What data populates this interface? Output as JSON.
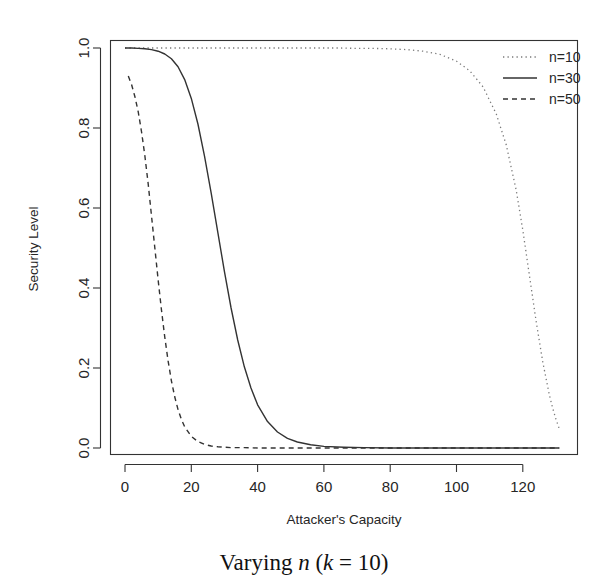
{
  "figure": {
    "caption_prefix": "Varying ",
    "caption_var_n": "n",
    "caption_mid": " (",
    "caption_var_k": "k",
    "caption_suffix": " = 10)"
  },
  "chart_data": {
    "type": "line",
    "title": "",
    "xlabel": "Attacker's Capacity",
    "ylabel": "Security Level",
    "xlim": [
      0,
      131
    ],
    "ylim": [
      0.0,
      1.0
    ],
    "xticks": [
      0,
      20,
      40,
      60,
      80,
      100,
      120
    ],
    "xtick_labels": [
      "0",
      "20",
      "40",
      "60",
      "80",
      "100",
      "120"
    ],
    "yticks": [
      0.0,
      0.2,
      0.4,
      0.6,
      0.8,
      1.0
    ],
    "ytick_labels": [
      "0.0",
      "0.2",
      "0.4",
      "0.6",
      "0.8",
      "1.0"
    ],
    "grid": false,
    "legend_position": "top-right",
    "box_style": "full-frame",
    "line_color": "#333333",
    "series": [
      {
        "name": "n=10",
        "style": "dotted",
        "dasharray": "1.3,3.2",
        "width": 1.3,
        "color": "#7a7a7a",
        "midpoint": 117.5,
        "steepness": 0.34,
        "ymax": 1.0,
        "x": [
          0,
          5,
          10,
          15,
          20,
          25,
          30,
          35,
          40,
          45,
          50,
          55,
          60,
          65,
          70,
          75,
          80,
          85,
          90,
          95,
          100,
          104,
          108,
          112,
          115,
          118,
          120,
          122,
          124,
          126,
          128,
          129,
          130,
          131
        ],
        "y": [
          1.0,
          1.0,
          1.0,
          1.0,
          1.0,
          1.0,
          1.0,
          1.0,
          1.0,
          1.0,
          1.0,
          1.0,
          1.0,
          1.0,
          0.999,
          0.999,
          0.998,
          0.996,
          0.992,
          0.984,
          0.967,
          0.943,
          0.903,
          0.835,
          0.758,
          0.645,
          0.545,
          0.431,
          0.318,
          0.216,
          0.133,
          0.1,
          0.072,
          0.048
        ]
      },
      {
        "name": "n=30",
        "style": "solid",
        "dasharray": "none",
        "width": 1.4,
        "color": "#333333",
        "midpoint": 29.5,
        "steepness": 0.115,
        "ymax": 1.0,
        "x": [
          0,
          2,
          4,
          6,
          8,
          10,
          12,
          14,
          16,
          18,
          20,
          22,
          24,
          26,
          28,
          30,
          32,
          34,
          36,
          38,
          40,
          43,
          46,
          49,
          52,
          56,
          60,
          66,
          72,
          80,
          90,
          100,
          110,
          120,
          131
        ],
        "y": [
          1.0,
          1.0,
          0.999,
          0.998,
          0.996,
          0.992,
          0.985,
          0.973,
          0.953,
          0.921,
          0.874,
          0.81,
          0.729,
          0.637,
          0.539,
          0.441,
          0.35,
          0.27,
          0.203,
          0.15,
          0.108,
          0.066,
          0.04,
          0.024,
          0.015,
          0.008,
          0.004,
          0.002,
          0.001,
          0.0,
          0.0,
          0.0,
          0.0,
          0.0,
          0.0
        ]
      },
      {
        "name": "n=50",
        "style": "dashed",
        "dasharray": "5,4",
        "width": 1.4,
        "color": "#333333",
        "midpoint": 9.0,
        "steepness": 0.33,
        "ymax": 0.93,
        "x": [
          1,
          2,
          3,
          4,
          5,
          6,
          7,
          8,
          9,
          10,
          11,
          12,
          13,
          14,
          15,
          16,
          17,
          18,
          20,
          22,
          24,
          26,
          28,
          32,
          36,
          40,
          50,
          60,
          70,
          85,
          100,
          115,
          131
        ],
        "y": [
          0.93,
          0.908,
          0.878,
          0.84,
          0.79,
          0.73,
          0.66,
          0.58,
          0.5,
          0.42,
          0.345,
          0.277,
          0.218,
          0.168,
          0.128,
          0.096,
          0.072,
          0.053,
          0.029,
          0.016,
          0.009,
          0.005,
          0.003,
          0.001,
          0.001,
          0.0,
          0.0,
          0.0,
          0.0,
          0.0,
          0.0,
          0.0,
          0.0
        ]
      }
    ]
  }
}
